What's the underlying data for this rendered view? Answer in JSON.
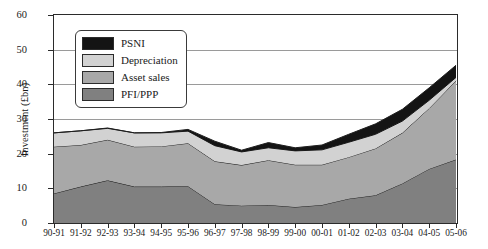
{
  "chart_data": {
    "type": "area",
    "title": "",
    "subtitle": "",
    "xlabel": "",
    "ylabel": "Investment (£bn)",
    "stacked": true,
    "grid": true,
    "legend_position": "inside-top-left",
    "ylim": [
      0,
      60
    ],
    "ytick_values": [
      0,
      10,
      20,
      30,
      40,
      50,
      60
    ],
    "ytick_labels": [
      "0",
      "10",
      "20",
      "30",
      "40",
      "50",
      "60"
    ],
    "categories": [
      "90-91",
      "91-92",
      "92-93",
      "93-94",
      "94-95",
      "95-96",
      "96-97",
      "97-98",
      "98-99",
      "99-00",
      "00-01",
      "01-02",
      "02-03",
      "03-04",
      "04-05",
      "05-06"
    ],
    "series": [
      {
        "name": "PFI/PPP",
        "color": "#808080",
        "values": [
          8.5,
          10.5,
          12.3,
          10.5,
          10.5,
          10.6,
          5.4,
          5.0,
          5.2,
          4.6,
          5.2,
          7.0,
          8.0,
          11.4,
          15.6,
          18.3
        ]
      },
      {
        "name": "Asset sales",
        "color": "#a8a8a8",
        "values": [
          13.5,
          12.0,
          11.7,
          11.5,
          11.6,
          12.4,
          12.4,
          11.7,
          12.9,
          12.2,
          11.6,
          12.0,
          13.5,
          14.6,
          17.5,
          22.7
        ]
      },
      {
        "name": "Depreciation",
        "color": "#d2d2d2",
        "values": [
          4.0,
          4.1,
          3.3,
          4.0,
          3.9,
          3.5,
          4.5,
          3.8,
          3.6,
          4.0,
          4.3,
          4.3,
          4.1,
          3.4,
          2.3,
          1.0
        ]
      },
      {
        "name": "PSNI",
        "color": "#141414",
        "values": [
          0.0,
          0.0,
          0.1,
          0.0,
          0.1,
          0.5,
          1.3,
          0.5,
          1.5,
          0.9,
          1.4,
          2.3,
          3.0,
          3.4,
          3.6,
          3.5
        ]
      }
    ],
    "totals": [
      26.0,
      26.6,
      27.4,
      26.0,
      26.1,
      27.0,
      23.6,
      21.0,
      23.2,
      21.7,
      22.5,
      25.6,
      28.6,
      32.8,
      39.0,
      45.5
    ],
    "legend_entries": [
      {
        "label": "PSNI",
        "color": "#141414"
      },
      {
        "label": "Depreciation",
        "color": "#d2d2d2"
      },
      {
        "label": "Asset sales",
        "color": "#a8a8a8"
      },
      {
        "label": "PFI/PPP",
        "color": "#808080"
      }
    ]
  }
}
